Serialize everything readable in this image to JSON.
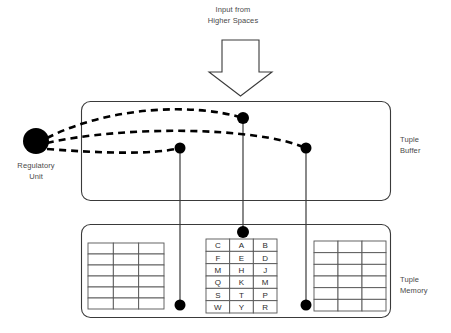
{
  "diagram": {
    "title_text": "Input from\nHigher Spaces",
    "regulatory_unit_label": "Regulatory\nUnit",
    "tuple_buffer_label": "Tuple\nBuffer",
    "tuple_memory_label": "Tuple\nMemory",
    "colors": {
      "stroke": "#3a3a3a",
      "node_fill": "#000000",
      "text": "#4a4a4a",
      "cell_text": "#2b2b2b",
      "background": "#ffffff",
      "grid_stroke": "#555555"
    },
    "tables": {
      "left": {
        "name": "left-tuple-table",
        "columns": 3,
        "rows": 6,
        "cells": [
          [
            "",
            "",
            ""
          ],
          [
            "",
            "",
            ""
          ],
          [
            "",
            "",
            ""
          ],
          [
            "",
            "",
            ""
          ],
          [
            "",
            "",
            ""
          ],
          [
            "",
            "",
            ""
          ]
        ]
      },
      "center": {
        "name": "center-tuple-table",
        "columns": 3,
        "rows": 6,
        "cells": [
          [
            "C",
            "A",
            "B"
          ],
          [
            "F",
            "E",
            "D"
          ],
          [
            "M",
            "H",
            "J"
          ],
          [
            "Q",
            "K",
            "M"
          ],
          [
            "S",
            "T",
            "P"
          ],
          [
            "W",
            "Y",
            "R"
          ]
        ]
      },
      "right": {
        "name": "right-tuple-table",
        "columns": 3,
        "rows": 6,
        "cells": [
          [
            "",
            "",
            ""
          ],
          [
            "",
            "",
            ""
          ],
          [
            "",
            "",
            ""
          ],
          [
            "",
            "",
            ""
          ],
          [
            "",
            "",
            ""
          ],
          [
            "",
            "",
            ""
          ]
        ]
      }
    },
    "nodes": [
      {
        "name": "regulatory-unit-node",
        "cx": 36,
        "cy": 141,
        "r": 13
      },
      {
        "name": "buffer-node-left",
        "cx": 180,
        "cy": 148,
        "r": 5.5
      },
      {
        "name": "buffer-node-center",
        "cx": 243,
        "cy": 118,
        "r": 6
      },
      {
        "name": "buffer-node-right",
        "cx": 306,
        "cy": 148,
        "r": 5.5
      },
      {
        "name": "memory-node-left",
        "cx": 180,
        "cy": 305,
        "r": 5.5
      },
      {
        "name": "memory-node-center",
        "cx": 243,
        "cy": 232,
        "r": 6
      },
      {
        "name": "memory-node-right",
        "cx": 306,
        "cy": 305,
        "r": 5.5
      }
    ]
  }
}
